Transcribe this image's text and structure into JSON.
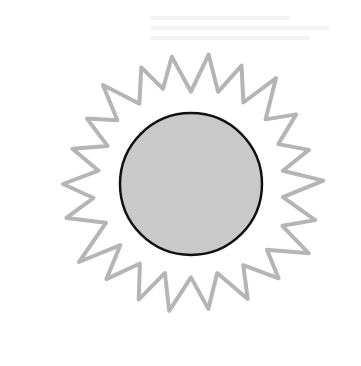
{
  "illustration": {
    "subject": "sun",
    "description": "Hand-drawn sun with a gray filled disc outlined in black, surrounded by a jagged gray flame-like ray outline",
    "center": [
      191,
      184
    ],
    "disc_radius": 71,
    "ray_outer_radius": 135,
    "ray_inner_radius": 96,
    "ray_count": 22,
    "colors": {
      "background": "#ffffff",
      "disc_fill": "#c9c9c9",
      "disc_stroke": "#111111",
      "ray_stroke": "#b5b5b5"
    }
  }
}
